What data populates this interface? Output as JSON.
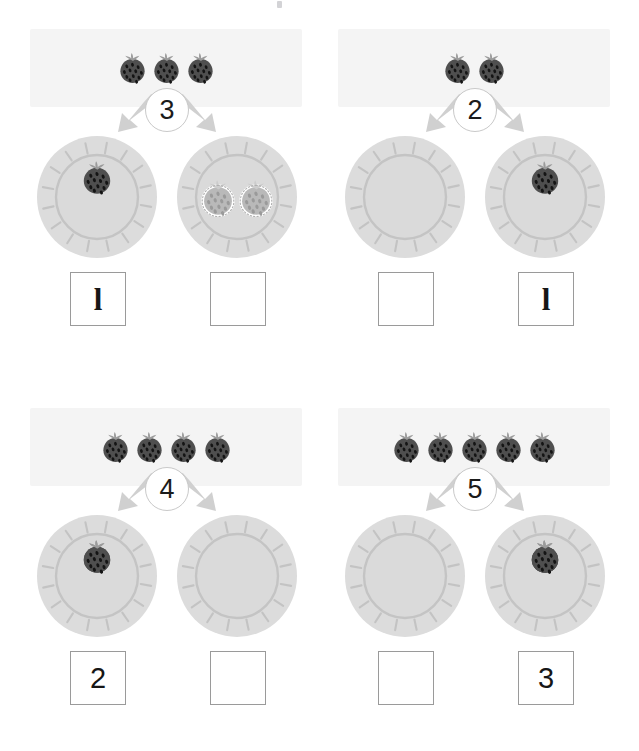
{
  "worksheet": {
    "title": "Number bonds with strawberries",
    "type": "counting-decomposition",
    "background_color": "#ffffff",
    "banner_color": "#f4f4f4",
    "plate_color": "#dcdcdc",
    "plate_ring_color": "#c4c4c4",
    "berry_color": "#4f4f4f",
    "berry_ghost_color": "#b9b9b9",
    "arrow_color": "#d0d0d0",
    "box_border_color": "#9a9a9a",
    "number_color": "#1b1b1b"
  },
  "problems": [
    {
      "id": "problem-1",
      "total": "3",
      "total_count": 3,
      "left": {
        "berries": 1,
        "ghost": 0,
        "answer": "l",
        "filled": true
      },
      "right": {
        "berries": 0,
        "ghost": 2,
        "answer": "",
        "filled": false
      }
    },
    {
      "id": "problem-2",
      "total": "2",
      "total_count": 2,
      "left": {
        "berries": 0,
        "ghost": 0,
        "answer": "",
        "filled": false
      },
      "right": {
        "berries": 1,
        "ghost": 0,
        "answer": "l",
        "filled": true
      }
    },
    {
      "id": "problem-3",
      "total": "4",
      "total_count": 4,
      "left": {
        "berries": 2,
        "ghost": 0,
        "answer": "2",
        "filled": true
      },
      "right": {
        "berries": 0,
        "ghost": 0,
        "answer": "",
        "filled": false
      }
    },
    {
      "id": "problem-4",
      "total": "5",
      "total_count": 5,
      "left": {
        "berries": 0,
        "ghost": 0,
        "answer": "",
        "filled": false
      },
      "right": {
        "berries": 3,
        "ghost": 0,
        "answer": "3",
        "filled": true
      }
    }
  ],
  "icons": {
    "berry": "strawberry-icon",
    "plate": "plate-icon",
    "arrow": "split-arrow-icon"
  }
}
